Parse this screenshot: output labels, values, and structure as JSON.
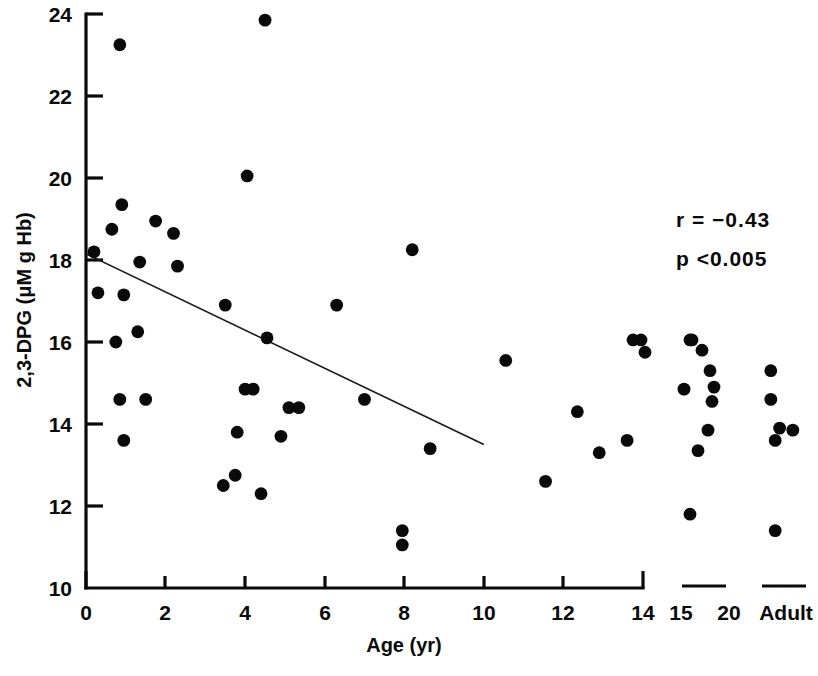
{
  "chart_data": {
    "type": "scatter",
    "title": "",
    "xlabel": "Age (yr)",
    "ylabel": "2,3-DPG (μM g Hb)",
    "xlim": [
      0,
      14
    ],
    "ylim": [
      10,
      24
    ],
    "grid": false,
    "legend": null,
    "x_ticks": [
      "0",
      "2",
      "4",
      "6",
      "8",
      "10",
      "12",
      "14"
    ],
    "x_tick_values": [
      0,
      2,
      4,
      6,
      8,
      10,
      12,
      14
    ],
    "extra_x_ticks": [
      "15",
      "20",
      "Adult"
    ],
    "y_ticks": [
      "10",
      "12",
      "14",
      "16",
      "18",
      "20",
      "22",
      "24"
    ],
    "y_tick_values": [
      10,
      12,
      14,
      16,
      18,
      20,
      22,
      24
    ],
    "annotations": [
      "r  =  −0.43",
      "p <0.005"
    ],
    "correlation_r": -0.43,
    "p_value": "<0.005",
    "trendline": {
      "x_start": 0,
      "y_start": 18.15,
      "x_end": 10,
      "y_end": 13.5
    },
    "points": [
      {
        "x": 0.2,
        "y": 18.2
      },
      {
        "x": 0.85,
        "y": 23.25
      },
      {
        "x": 0.3,
        "y": 17.2
      },
      {
        "x": 0.65,
        "y": 18.75
      },
      {
        "x": 0.75,
        "y": 16.0
      },
      {
        "x": 0.9,
        "y": 19.35
      },
      {
        "x": 0.95,
        "y": 17.15
      },
      {
        "x": 0.85,
        "y": 14.6
      },
      {
        "x": 0.95,
        "y": 13.6
      },
      {
        "x": 1.35,
        "y": 17.95
      },
      {
        "x": 1.3,
        "y": 16.25
      },
      {
        "x": 1.5,
        "y": 14.6
      },
      {
        "x": 1.75,
        "y": 18.95
      },
      {
        "x": 2.2,
        "y": 18.65
      },
      {
        "x": 2.3,
        "y": 17.85
      },
      {
        "x": 3.45,
        "y": 12.5
      },
      {
        "x": 3.5,
        "y": 16.9
      },
      {
        "x": 3.8,
        "y": 13.8
      },
      {
        "x": 3.75,
        "y": 12.75
      },
      {
        "x": 4.0,
        "y": 14.85
      },
      {
        "x": 4.2,
        "y": 14.85
      },
      {
        "x": 4.05,
        "y": 20.05
      },
      {
        "x": 4.5,
        "y": 23.85
      },
      {
        "x": 4.55,
        "y": 16.1
      },
      {
        "x": 4.4,
        "y": 12.3
      },
      {
        "x": 4.9,
        "y": 13.7
      },
      {
        "x": 5.1,
        "y": 14.4
      },
      {
        "x": 5.35,
        "y": 14.4
      },
      {
        "x": 6.3,
        "y": 16.9
      },
      {
        "x": 7.0,
        "y": 14.6
      },
      {
        "x": 7.95,
        "y": 11.4
      },
      {
        "x": 7.95,
        "y": 11.05
      },
      {
        "x": 8.2,
        "y": 18.25
      },
      {
        "x": 8.65,
        "y": 13.4
      },
      {
        "x": 10.55,
        "y": 15.55
      },
      {
        "x": 11.55,
        "y": 12.6
      },
      {
        "x": 12.35,
        "y": 14.3
      },
      {
        "x": 12.9,
        "y": 13.3
      },
      {
        "x": 13.6,
        "y": 13.6
      },
      {
        "x": 13.75,
        "y": 16.05
      },
      {
        "x": 13.95,
        "y": 16.05
      },
      {
        "x": 14.05,
        "y": 15.75
      },
      {
        "x": 15.0,
        "y": 16.05
      },
      {
        "x": 15.05,
        "y": 16.05
      },
      {
        "x": 15.3,
        "y": 15.8
      },
      {
        "x": 15.5,
        "y": 15.3
      },
      {
        "x": 15.6,
        "y": 14.9
      },
      {
        "x": 14.85,
        "y": 14.85
      },
      {
        "x": 15.55,
        "y": 14.55
      },
      {
        "x": 15.45,
        "y": 13.85
      },
      {
        "x": 15.2,
        "y": 13.35
      },
      {
        "x": 15.0,
        "y": 11.8
      },
      {
        "x": 20.3,
        "y": 15.3
      },
      {
        "x": 20.3,
        "y": 14.6
      },
      {
        "x": 20.4,
        "y": 13.9
      },
      {
        "x": 20.55,
        "y": 13.85
      },
      {
        "x": 20.35,
        "y": 13.6
      },
      {
        "x": 20.35,
        "y": 11.4
      }
    ]
  },
  "axes": {
    "y_axis_name": "2,3-DPG (μM g Hb)",
    "x_axis_name": "Age (yr)"
  },
  "stats": {
    "r_label": "r  =  −0.43",
    "p_label": "p <0.005"
  },
  "segments": [
    {
      "name": "teen-segment",
      "labels": [
        "15",
        "20"
      ]
    },
    {
      "name": "adult-segment",
      "labels": [
        "Adult"
      ]
    }
  ]
}
